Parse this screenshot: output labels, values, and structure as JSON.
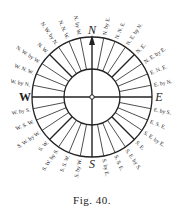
{
  "figure": {
    "caption": "Fig. 40.",
    "center": [
      92,
      97
    ],
    "outer_radius": 60,
    "inner_radius": 28,
    "line_color": "#222222",
    "cardinals": [
      "N",
      "E",
      "S",
      "W"
    ],
    "points": [
      "N",
      "N. by E.",
      "N. N. E.",
      "N. E. by N.",
      "N. E.",
      "N. E. by E.",
      "E. N. E.",
      "E. by N.",
      "E",
      "E. by S.",
      "E. S. E.",
      "S. E. by E.",
      "S. E.",
      "S. E. by S.",
      "S. S. E.",
      "S. by E.",
      "S",
      "S. by W.",
      "S. S. W.",
      "S. W. by S.",
      "S. W.",
      "S. W. by W.",
      "W. S. W.",
      "W. by S.",
      "W",
      "W. by N.",
      "W. N. W.",
      "N. W. by W.",
      "N. W.",
      "N. W. by N.",
      "N. N. W.",
      "N. by W."
    ]
  }
}
